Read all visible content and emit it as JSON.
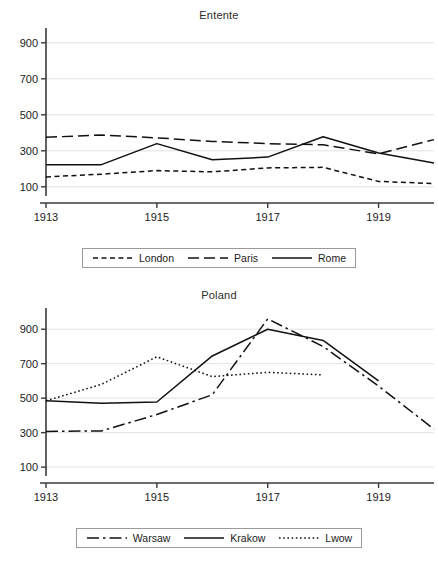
{
  "chart_data": [
    {
      "type": "line",
      "title": "Entente",
      "xlabel": "",
      "ylabel": "",
      "xlim": [
        1913,
        1920
      ],
      "ylim": [
        60,
        960
      ],
      "yticks": [
        100,
        300,
        500,
        700,
        900
      ],
      "xticks": [
        1913,
        1915,
        1917,
        1919
      ],
      "xtick_labels": [
        "1913",
        "1915",
        "1917",
        "1919"
      ],
      "ytick_labels": [
        "100",
        "300",
        "500",
        "700",
        "900"
      ],
      "grid": "horizontal",
      "legend_position": "bottom",
      "series": [
        {
          "name": "London",
          "style": "short-dash",
          "x": [
            1913,
            1914,
            1915,
            1916,
            1917,
            1918,
            1919,
            1920
          ],
          "values": [
            155,
            170,
            190,
            183,
            205,
            208,
            130,
            118
          ]
        },
        {
          "name": "Paris",
          "style": "long-dash",
          "x": [
            1913,
            1914,
            1915,
            1916,
            1917,
            1918,
            1919,
            1920
          ],
          "values": [
            375,
            388,
            372,
            352,
            340,
            333,
            283,
            362
          ]
        },
        {
          "name": "Rome",
          "style": "solid",
          "x": [
            1913,
            1914,
            1915,
            1916,
            1917,
            1918,
            1919,
            1920
          ],
          "values": [
            222,
            223,
            340,
            250,
            265,
            378,
            288,
            232
          ]
        }
      ]
    },
    {
      "type": "line",
      "title": "Poland",
      "xlabel": "",
      "ylabel": "",
      "xlim": [
        1913,
        1920
      ],
      "ylim": [
        60,
        1000
      ],
      "yticks": [
        100,
        300,
        500,
        700,
        900
      ],
      "xticks": [
        1913,
        1915,
        1917,
        1919
      ],
      "xtick_labels": [
        "1913",
        "1915",
        "1917",
        "1919"
      ],
      "ytick_labels": [
        "100",
        "300",
        "500",
        "700",
        "900"
      ],
      "grid": "horizontal",
      "legend_position": "bottom",
      "series": [
        {
          "name": "Warsaw",
          "style": "dash-dot",
          "x": [
            1913,
            1914,
            1915,
            1916,
            1917,
            1918,
            1919,
            1920
          ],
          "values": [
            307,
            310,
            405,
            520,
            960,
            800,
            570,
            320
          ]
        },
        {
          "name": "Krakow",
          "style": "solid",
          "x": [
            1913,
            1914,
            1915,
            1916,
            1917,
            1918,
            1919
          ],
          "values": [
            485,
            470,
            478,
            745,
            900,
            835,
            600
          ]
        },
        {
          "name": "Lwow",
          "style": "dotted",
          "x": [
            1913,
            1914,
            1915,
            1916,
            1917,
            1918
          ],
          "values": [
            485,
            580,
            740,
            625,
            650,
            635
          ]
        }
      ]
    }
  ],
  "legends": [
    {
      "items": [
        {
          "label": "London",
          "style": "short-dash"
        },
        {
          "label": "Paris",
          "style": "long-dash"
        },
        {
          "label": "Rome",
          "style": "solid"
        }
      ]
    },
    {
      "items": [
        {
          "label": "Warsaw",
          "style": "dash-dot"
        },
        {
          "label": "Krakow",
          "style": "solid"
        },
        {
          "label": "Lwow",
          "style": "dotted"
        }
      ]
    }
  ]
}
